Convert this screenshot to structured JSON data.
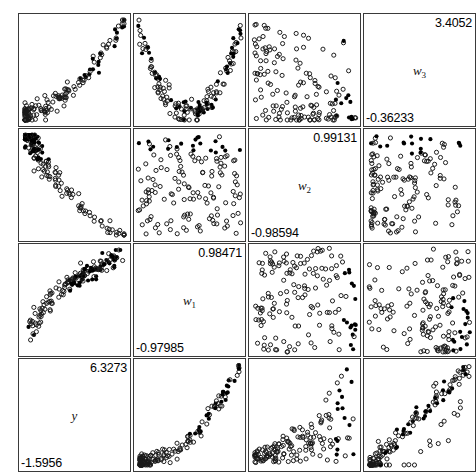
{
  "figure": {
    "type": "scatter-plot-matrix",
    "rows": 4,
    "cols": 4,
    "background": "#ffffff",
    "border_color": "#3a3a3a",
    "marker_colors": {
      "open": "#1a1a1a",
      "filled": "#000000"
    }
  },
  "chart_data": {
    "type": "scatter",
    "title": "",
    "xlabel": "",
    "ylabel": "",
    "grid": false,
    "legend": "none",
    "layout": "4x4 scatter plot matrix, variable name panels on the anti-diagonal",
    "variables": [
      {
        "name": "w3",
        "label": "w",
        "subscript": "3",
        "max": "3.4052",
        "min": "-0.36233",
        "max_value": 3.4052,
        "min_value": -0.36233
      },
      {
        "name": "w2",
        "label": "w",
        "subscript": "2",
        "max": "0.99131",
        "min": "-0.98594",
        "max_value": 0.99131,
        "min_value": -0.98594
      },
      {
        "name": "w1",
        "label": "w",
        "subscript": "1",
        "max": "0.98471",
        "min": "-0.97985",
        "max_value": 0.98471,
        "min_value": -0.97985
      },
      {
        "name": "y",
        "label": "y",
        "subscript": "",
        "max": "6.3273",
        "min": "-1.5956",
        "max_value": 6.3273,
        "min_value": -1.5956
      }
    ],
    "marker_classes": [
      {
        "name": "open-circle",
        "style": "hollow circle, dark outline"
      },
      {
        "name": "filled-circle",
        "style": "solid black circle"
      }
    ],
    "panels": [
      {
        "row": 0,
        "col": 0,
        "kind": "scatter",
        "pattern": "rising-fan"
      },
      {
        "row": 0,
        "col": 1,
        "kind": "scatter",
        "pattern": "u-shape"
      },
      {
        "row": 0,
        "col": 2,
        "kind": "scatter",
        "pattern": "bottom-cluster-right-tail"
      },
      {
        "row": 0,
        "col": 3,
        "kind": "diagonal",
        "variable": "w3"
      },
      {
        "row": 1,
        "col": 0,
        "kind": "scatter",
        "pattern": "top-arc"
      },
      {
        "row": 1,
        "col": 1,
        "kind": "scatter",
        "pattern": "top-band"
      },
      {
        "row": 1,
        "col": 2,
        "kind": "diagonal",
        "variable": "w2"
      },
      {
        "row": 1,
        "col": 3,
        "kind": "scatter",
        "pattern": "left-cluster-top-band"
      },
      {
        "row": 2,
        "col": 0,
        "kind": "scatter",
        "pattern": "curved-arc"
      },
      {
        "row": 2,
        "col": 1,
        "kind": "diagonal",
        "variable": "w1"
      },
      {
        "row": 2,
        "col": 2,
        "kind": "scatter",
        "pattern": "uniform-right-edge"
      },
      {
        "row": 2,
        "col": 3,
        "kind": "scatter",
        "pattern": "uniform-bottom-right"
      },
      {
        "row": 3,
        "col": 0,
        "kind": "diagonal",
        "variable": "y"
      },
      {
        "row": 3,
        "col": 1,
        "kind": "scatter",
        "pattern": "rising-curve"
      },
      {
        "row": 3,
        "col": 2,
        "kind": "scatter",
        "pattern": "rising-wedge"
      },
      {
        "row": 3,
        "col": 3,
        "kind": "scatter",
        "pattern": "positive-diagonal"
      }
    ]
  }
}
